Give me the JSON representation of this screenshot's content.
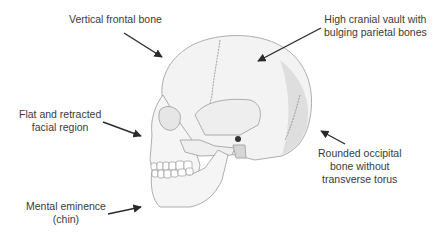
{
  "diagram": {
    "colors": {
      "background": "#ffffff",
      "text": "#3a3a3a",
      "arrow": "#2b2b2b",
      "bone_fill": "#f2f2f2",
      "bone_shade": "#dcdcdc",
      "bone_outline": "#9a9a9a"
    },
    "labels": [
      {
        "id": "frontal",
        "lines": [
          "Vertical frontal bone"
        ]
      },
      {
        "id": "parietal",
        "lines": [
          "High cranial vault with",
          "bulging parietal bones"
        ]
      },
      {
        "id": "facial",
        "lines": [
          "Flat and retracted",
          "facial region"
        ]
      },
      {
        "id": "chin",
        "lines": [
          "Mental eminence",
          "(chin)"
        ]
      },
      {
        "id": "occipital",
        "lines": [
          "Rounded occipital",
          "bone without",
          "transverse torus"
        ]
      }
    ]
  }
}
